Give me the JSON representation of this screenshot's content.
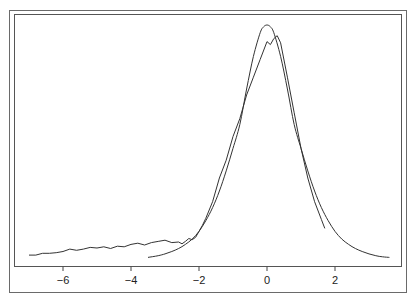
{
  "chart_data": {
    "type": "line",
    "title": "",
    "xlabel": "",
    "ylabel": "",
    "xlim": [
      -7.3,
      3.9
    ],
    "ylim": [
      0,
      0.42
    ],
    "grid": false,
    "legend": null,
    "x_ticks": [
      -6,
      -4,
      -2,
      0,
      2
    ],
    "x_tick_labels": [
      "−6",
      "−4",
      "−2",
      "0",
      "2"
    ],
    "y_ticks": [],
    "series": [
      {
        "name": "smooth-density",
        "style": "smooth",
        "x": [
          -3.5,
          -3.2,
          -3.0,
          -2.8,
          -2.6,
          -2.4,
          -2.2,
          -2.0,
          -1.8,
          -1.6,
          -1.4,
          -1.2,
          -1.0,
          -0.8,
          -0.6,
          -0.4,
          -0.2,
          -0.1,
          0.0,
          0.1,
          0.2,
          0.4,
          0.6,
          0.8,
          1.0,
          1.2,
          1.4,
          1.6,
          1.8,
          2.0,
          2.2,
          2.4,
          2.6,
          2.8,
          3.0,
          3.2,
          3.4,
          3.6
        ],
        "y": [
          0.006,
          0.009,
          0.012,
          0.016,
          0.021,
          0.028,
          0.037,
          0.05,
          0.068,
          0.09,
          0.118,
          0.152,
          0.19,
          0.23,
          0.29,
          0.345,
          0.385,
          0.395,
          0.398,
          0.395,
          0.385,
          0.345,
          0.29,
          0.23,
          0.19,
          0.152,
          0.118,
          0.09,
          0.068,
          0.05,
          0.037,
          0.028,
          0.021,
          0.016,
          0.012,
          0.009,
          0.007,
          0.006
        ]
      },
      {
        "name": "empirical-density",
        "style": "jagged",
        "x": [
          -7.0,
          -6.8,
          -6.6,
          -6.4,
          -6.2,
          -6.0,
          -5.8,
          -5.6,
          -5.4,
          -5.2,
          -5.0,
          -4.8,
          -4.6,
          -4.4,
          -4.2,
          -4.0,
          -3.8,
          -3.6,
          -3.4,
          -3.2,
          -3.0,
          -2.8,
          -2.6,
          -2.5,
          -2.4,
          -2.3,
          -2.2,
          -2.1,
          -2.0,
          -1.9,
          -1.8,
          -1.6,
          -1.4,
          -1.2,
          -1.0,
          -0.8,
          -0.6,
          -0.4,
          -0.2,
          0.0,
          0.1,
          0.2,
          0.3,
          0.4,
          0.6,
          0.8,
          1.0,
          1.2,
          1.4,
          1.6,
          1.7
        ],
        "y": [
          0.01,
          0.01,
          0.013,
          0.013,
          0.014,
          0.016,
          0.02,
          0.018,
          0.02,
          0.023,
          0.022,
          0.024,
          0.021,
          0.025,
          0.024,
          0.028,
          0.03,
          0.027,
          0.031,
          0.033,
          0.035,
          0.031,
          0.032,
          0.029,
          0.033,
          0.038,
          0.036,
          0.04,
          0.05,
          0.06,
          0.072,
          0.1,
          0.14,
          0.17,
          0.21,
          0.24,
          0.28,
          0.31,
          0.34,
          0.37,
          0.365,
          0.375,
          0.38,
          0.368,
          0.31,
          0.25,
          0.19,
          0.14,
          0.1,
          0.07,
          0.055
        ]
      }
    ]
  }
}
